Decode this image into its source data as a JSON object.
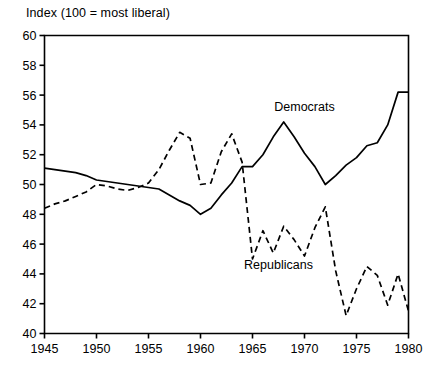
{
  "chart_data": {
    "type": "line",
    "title": "Index  (100 = most liberal)",
    "xlabel": "",
    "ylabel": "",
    "xlim": [
      1945,
      1980
    ],
    "ylim": [
      40,
      60
    ],
    "ytick_step": 2,
    "xtick_step": 5,
    "xticks": [
      1945,
      1950,
      1955,
      1960,
      1965,
      1970,
      1975,
      1980
    ],
    "yticks": [
      40,
      42,
      44,
      46,
      48,
      50,
      52,
      54,
      56,
      58,
      60
    ],
    "grid": false,
    "legend_position": "inline-annotation",
    "series": [
      {
        "name": "Democrats",
        "style": "solid",
        "color": "#000000",
        "label_x": 1970.0,
        "label_y": 55.2,
        "x": [
          1945,
          1946,
          1947,
          1948,
          1949,
          1950,
          1951,
          1952,
          1953,
          1954,
          1955,
          1956,
          1957,
          1958,
          1959,
          1960,
          1961,
          1962,
          1963,
          1964,
          1965,
          1966,
          1967,
          1968,
          1969,
          1970,
          1971,
          1972,
          1973,
          1974,
          1975,
          1976,
          1977,
          1978,
          1979,
          1980
        ],
        "values": [
          51.1,
          51.0,
          50.9,
          50.8,
          50.6,
          50.3,
          50.2,
          50.1,
          50.0,
          49.9,
          49.8,
          49.7,
          49.3,
          48.9,
          48.6,
          48.0,
          48.4,
          49.3,
          50.1,
          51.2,
          51.2,
          52.0,
          53.2,
          54.2,
          53.2,
          52.1,
          51.2,
          50.0,
          50.6,
          51.3,
          51.8,
          52.6,
          52.8,
          54.0,
          56.2,
          56.2
        ]
      },
      {
        "name": "Republicans",
        "style": "dashed",
        "color": "#000000",
        "label_x": 1967.5,
        "label_y": 44.6,
        "x": [
          1945,
          1946,
          1947,
          1948,
          1949,
          1950,
          1951,
          1952,
          1953,
          1954,
          1955,
          1956,
          1957,
          1958,
          1959,
          1960,
          1961,
          1962,
          1963,
          1964,
          1965,
          1966,
          1967,
          1968,
          1969,
          1970,
          1971,
          1972,
          1973,
          1974,
          1975,
          1976,
          1977,
          1978,
          1979,
          1980
        ],
        "values": [
          48.4,
          48.7,
          48.9,
          49.2,
          49.5,
          50.0,
          49.9,
          49.7,
          49.6,
          49.8,
          50.1,
          51.0,
          52.3,
          53.5,
          53.1,
          50.0,
          50.1,
          52.2,
          53.4,
          51.5,
          45.0,
          46.9,
          45.4,
          47.2,
          46.3,
          45.2,
          47.1,
          48.5,
          44.2,
          41.2,
          43.0,
          44.5,
          43.9,
          41.9,
          44.0,
          41.5
        ]
      }
    ]
  }
}
